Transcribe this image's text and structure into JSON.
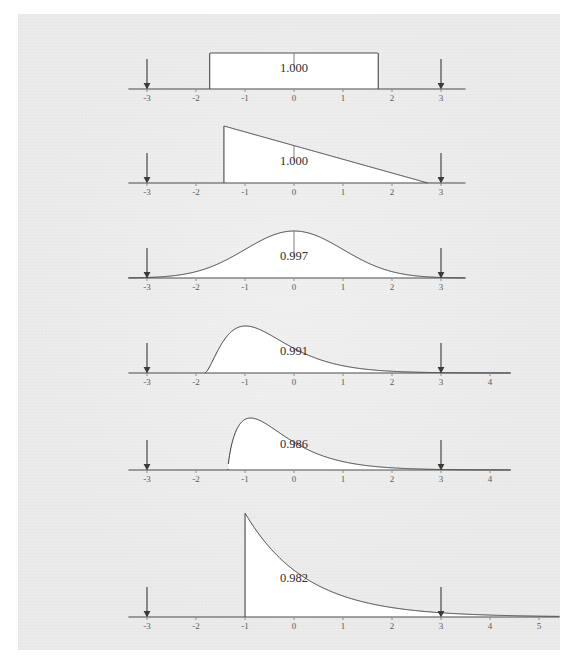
{
  "figure": {
    "title": "",
    "background_color": "#ebebeb",
    "page_color": "#ffffff",
    "axis_color": "#4a4a4a",
    "curve_color": "#3a3a3a",
    "fill_color": "#ffffff",
    "label_color": "#5a5a5a",
    "arrow_color": "#3a3a3a",
    "unit_px": 49,
    "origin_x_px": 294
  },
  "chart_data": {
    "type": "area",
    "title": "",
    "xlabel": "",
    "ylabel": "",
    "grid": false,
    "legend": false,
    "shared_markers": [
      -3,
      3
    ],
    "panels": [
      {
        "index": 1,
        "name": "uniform",
        "distribution": "uniform",
        "area_label": "1.000",
        "area_value": 1.0,
        "support": [
          -1.72,
          1.72
        ],
        "xticks": [
          -3,
          -2,
          -1,
          0,
          1,
          2,
          3
        ],
        "xtick_labels": [
          "-3",
          "-2",
          "-1",
          "0",
          "1",
          "2",
          "3"
        ],
        "xlim": [
          -3.4,
          3.5
        ],
        "markers": [
          -3,
          3
        ],
        "peak_x": 0.0
      },
      {
        "index": 2,
        "name": "triangular",
        "distribution": "right triangular",
        "area_label": "1.000",
        "area_value": 1.0,
        "support": [
          -1.43,
          2.73
        ],
        "xticks": [
          -3,
          -2,
          -1,
          0,
          1,
          2,
          3
        ],
        "xtick_labels": [
          "-3",
          "-2",
          "-1",
          "0",
          "1",
          "2",
          "3"
        ],
        "xlim": [
          -3.4,
          3.5
        ],
        "markers": [
          -3,
          3
        ],
        "peak_x": -1.43
      },
      {
        "index": 3,
        "name": "normal",
        "distribution": "normal",
        "area_label": "0.997",
        "area_value": 0.997,
        "support": [
          -3.4,
          3.5
        ],
        "xticks": [
          -3,
          -2,
          -1,
          0,
          1,
          2,
          3
        ],
        "xtick_labels": [
          "-3",
          "-2",
          "-1",
          "0",
          "1",
          "2",
          "3"
        ],
        "xlim": [
          -3.4,
          3.5
        ],
        "markers": [
          -3,
          3
        ],
        "peak_x": 0.0
      },
      {
        "index": 4,
        "name": "moderately-skewed",
        "distribution": "gamma (low skew)",
        "area_label": "0.991",
        "area_value": 0.991,
        "support": [
          -1.82,
          4.3
        ],
        "xticks": [
          -3,
          -2,
          -1,
          0,
          1,
          2,
          3,
          4
        ],
        "xtick_labels": [
          "-3",
          "-2",
          "-1",
          "0",
          "1",
          "2",
          "3",
          "4"
        ],
        "xlim": [
          -3.4,
          4.4
        ],
        "markers": [
          -3,
          3
        ],
        "peak_x": -0.45
      },
      {
        "index": 5,
        "name": "strongly-skewed",
        "distribution": "gamma (high skew)",
        "area_label": "0.986",
        "area_value": 0.986,
        "support": [
          -1.35,
          4.3
        ],
        "xticks": [
          -3,
          -2,
          -1,
          0,
          1,
          2,
          3,
          4
        ],
        "xtick_labels": [
          "-3",
          "-2",
          "-1",
          "0",
          "1",
          "2",
          "3",
          "4"
        ],
        "xlim": [
          -3.4,
          4.4
        ],
        "markers": [
          -3,
          3
        ],
        "peak_x": -0.72
      },
      {
        "index": 6,
        "name": "exponential",
        "distribution": "exponential",
        "area_label": "0.982",
        "area_value": 0.982,
        "support": [
          -1.0,
          5.3
        ],
        "xticks": [
          -3,
          -2,
          -1,
          0,
          1,
          2,
          3,
          4,
          5
        ],
        "xtick_labels": [
          "-3",
          "-2",
          "-1",
          "0",
          "1",
          "2",
          "3",
          "4",
          "5"
        ],
        "xlim": [
          -3.4,
          5.4
        ],
        "markers": [
          -3,
          3
        ],
        "peak_x": -1.0
      }
    ]
  }
}
